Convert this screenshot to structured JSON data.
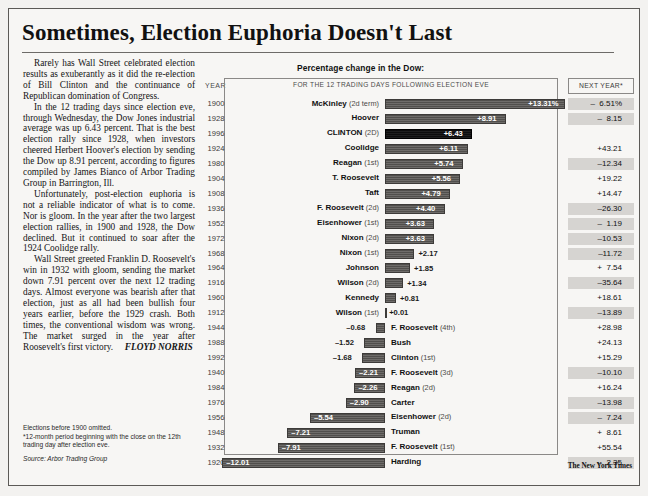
{
  "headline": "Sometimes, Election Euphoria Doesn't Last",
  "story": {
    "paragraphs": [
      "Rarely has Wall Street celebrated election results as exuberantly as it did the re-election of Bill Clinton and the continuance of Republican domination of Congress.",
      "In the 12 trading days since election eve, through Wednesday, the Dow Jones industrial average was up 6.43 percent. That is the best election rally since 1928, when investors cheered Herbert Hoover's election by sending the Dow up 8.91 percent, according to figures compiled by James Bianco of Arbor Trading Group in Barrington, Ill.",
      "Unfortunately, post-election euphoria is not a reliable indicator of what is to come. Nor is gloom. In the year after the two largest election rallies, in 1900 and 1928, the Dow declined. But it continued to soar after the 1924 Coolidge rally.",
      "Wall Street greeted Franklin D. Roosevelt's win in 1932 with gloom, sending the market down 7.91 percent over the next 12 trading days. Almost everyone was bearish after that election, just as all had been bullish four years earlier, before the 1929 crash. Both times, the conventional wisdom was wrong. The market surged in the year after Roosevelt's first victory."
    ],
    "byline": "FLOYD NORRIS",
    "notes": [
      "Elections before 1900 omitted.",
      "*12-month period beginning with the close on the 12th trading day after election eve."
    ],
    "source": "Source: Arbor Trading Group"
  },
  "chart_headers": {
    "title": "Percentage change in the Dow:",
    "year_label": "YEAR",
    "subtitle": "FOR THE 12 TRADING DAYS FOLLOWING ELECTION EVE",
    "next_year_label": "NEXT YEAR*"
  },
  "credit": "The New York Times",
  "chart_data": {
    "type": "bar",
    "xlabel": "Percent change",
    "ylabel": "Year / President",
    "orientation": "horizontal",
    "grid": false,
    "legend": null,
    "xlim": [
      -13,
      14
    ],
    "zero_line": true,
    "highlight": "CLINTON (2D)",
    "columns": [
      "YEAR",
      "President",
      "12 trading days after election eve (%)",
      "NEXT YEAR* (%)"
    ],
    "rows": [
      {
        "year": "1900",
        "name": "McKinley",
        "ord": "(2d term)",
        "value": 13.31,
        "label": "+13.31%",
        "next": "–  6.51%",
        "next_neg": true,
        "highlight": false
      },
      {
        "year": "1928",
        "name": "Hoover",
        "ord": "",
        "value": 8.91,
        "label": "+8.91",
        "next": "–  8.15",
        "next_neg": true,
        "highlight": false
      },
      {
        "year": "1996",
        "name": "CLINTON",
        "ord": "(2D)",
        "value": 6.43,
        "label": "+6.43",
        "next": "",
        "next_neg": false,
        "highlight": true
      },
      {
        "year": "1924",
        "name": "Coolidge",
        "ord": "",
        "value": 6.11,
        "label": "+6.11",
        "next": "+43.21",
        "next_neg": false,
        "highlight": false
      },
      {
        "year": "1980",
        "name": "Reagan",
        "ord": "(1st)",
        "value": 5.74,
        "label": "+5.74",
        "next": "–12.34",
        "next_neg": true,
        "highlight": false
      },
      {
        "year": "1904",
        "name": "T. Roosevelt",
        "ord": "",
        "value": 5.56,
        "label": "+5.56",
        "next": "+19.22",
        "next_neg": false,
        "highlight": false
      },
      {
        "year": "1908",
        "name": "Taft",
        "ord": "",
        "value": 4.79,
        "label": "+4.79",
        "next": "+14.47",
        "next_neg": false,
        "highlight": false
      },
      {
        "year": "1936",
        "name": "F. Roosevelt",
        "ord": "(2d)",
        "value": 4.4,
        "label": "+4.40",
        "next": "–26.30",
        "next_neg": true,
        "highlight": false
      },
      {
        "year": "1952",
        "name": "Eisenhower",
        "ord": "(1st)",
        "value": 3.63,
        "label": "+3.63",
        "next": "–  1.19",
        "next_neg": true,
        "highlight": false
      },
      {
        "year": "1972",
        "name": "Nixon",
        "ord": "(2d)",
        "value": 3.63,
        "label": "+3.63",
        "next": "–10.53",
        "next_neg": true,
        "highlight": false
      },
      {
        "year": "1968",
        "name": "Nixon",
        "ord": "(1st)",
        "value": 2.17,
        "label": "+2.17",
        "next": "–11.72",
        "next_neg": true,
        "highlight": false
      },
      {
        "year": "1964",
        "name": "Johnson",
        "ord": "",
        "value": 1.85,
        "label": "+1.85",
        "next": "+  7.54",
        "next_neg": false,
        "highlight": false
      },
      {
        "year": "1916",
        "name": "Wilson",
        "ord": "(2d)",
        "value": 1.34,
        "label": "+1.34",
        "next": "–35.64",
        "next_neg": true,
        "highlight": false
      },
      {
        "year": "1960",
        "name": "Kennedy",
        "ord": "",
        "value": 0.81,
        "label": "+0.81",
        "next": "+18.61",
        "next_neg": false,
        "highlight": false
      },
      {
        "year": "1912",
        "name": "Wilson",
        "ord": "(1st)",
        "value": 0.01,
        "label": "+0.01",
        "next": "–13.89",
        "next_neg": true,
        "highlight": false
      },
      {
        "year": "1944",
        "name": "F. Roosevelt",
        "ord": "(4th)",
        "value": -0.68,
        "label": "–0.68",
        "next": "+28.98",
        "next_neg": false,
        "highlight": false
      },
      {
        "year": "1988",
        "name": "Bush",
        "ord": "",
        "value": -1.52,
        "label": "–1.52",
        "next": "+24.13",
        "next_neg": false,
        "highlight": false
      },
      {
        "year": "1992",
        "name": "Clinton",
        "ord": "(1st)",
        "value": -1.68,
        "label": "–1.68",
        "next": "+15.29",
        "next_neg": false,
        "highlight": false
      },
      {
        "year": "1940",
        "name": "F. Roosevelt",
        "ord": "(3d)",
        "value": -2.21,
        "label": "–2.21",
        "next": "–10.10",
        "next_neg": true,
        "highlight": false
      },
      {
        "year": "1984",
        "name": "Reagan",
        "ord": "(2d)",
        "value": -2.26,
        "label": "–2.26",
        "next": "+16.24",
        "next_neg": false,
        "highlight": false
      },
      {
        "year": "1976",
        "name": "Carter",
        "ord": "",
        "value": -2.9,
        "label": "–2.90",
        "next": "–13.98",
        "next_neg": true,
        "highlight": false
      },
      {
        "year": "1956",
        "name": "Eisenhower",
        "ord": "(2d)",
        "value": -5.54,
        "label": "–5.54",
        "next": "–  7.24",
        "next_neg": true,
        "highlight": false
      },
      {
        "year": "1948",
        "name": "Truman",
        "ord": "",
        "value": -7.21,
        "label": "–7.21",
        "next": "+  8.61",
        "next_neg": false,
        "highlight": false
      },
      {
        "year": "1932",
        "name": "F. Roosevelt",
        "ord": "(1st)",
        "value": -7.91,
        "label": "–7.91",
        "next": "+55.54",
        "next_neg": false,
        "highlight": false
      },
      {
        "year": "1920",
        "name": "Harding",
        "ord": "",
        "value": -12.01,
        "label": "–12.01",
        "next": "–  2.35",
        "next_neg": true,
        "highlight": false
      }
    ]
  }
}
